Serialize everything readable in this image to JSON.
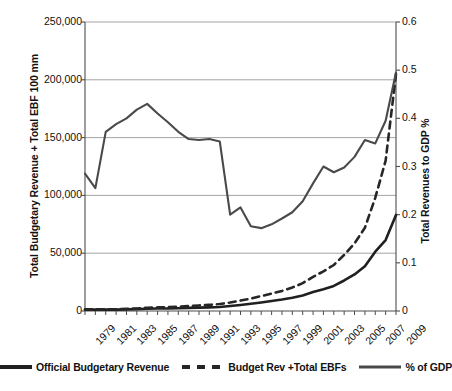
{
  "chart_data": {
    "type": "line",
    "title": "",
    "xlabel": "",
    "ylabel": "Total Budgetary Revenue + Total EBF 100 mm",
    "ylabel_secondary": "Total Revenues to GDP %",
    "grid": true,
    "legend_position": "bottom",
    "x": [
      1979,
      1980,
      1981,
      1982,
      1983,
      1984,
      1985,
      1986,
      1987,
      1988,
      1989,
      1990,
      1991,
      1992,
      1993,
      1994,
      1995,
      1996,
      1997,
      1998,
      1999,
      2000,
      2001,
      2002,
      2003,
      2004,
      2005,
      2006,
      2007,
      2008,
      2009
    ],
    "xtick_labels": [
      "1979",
      "1981",
      "1983",
      "1985",
      "1987",
      "1989",
      "1991",
      "1993",
      "1995",
      "1997",
      "1999",
      "2001",
      "2003",
      "2005",
      "2007",
      "2009"
    ],
    "ylim": [
      0,
      250000
    ],
    "ytick_labels": [
      "0",
      "50,000",
      "100,000",
      "150,000",
      "200,000",
      "250,000"
    ],
    "ytick_values": [
      0,
      50000,
      100000,
      150000,
      200000,
      250000
    ],
    "ylim_secondary": [
      0,
      0.6
    ],
    "ytick_labels_secondary": [
      "0",
      "0.1",
      "0.2",
      "0.3",
      "0.4",
      "0.5",
      "0.6"
    ],
    "ytick_values_secondary": [
      0,
      0.1,
      0.2,
      0.3,
      0.4,
      0.5,
      0.6
    ],
    "series": [
      {
        "name": "Official Budgetary Revenue",
        "axis": "left",
        "style": "solid",
        "width": 2.6,
        "color": "#202020",
        "values": [
          1146,
          1160,
          1176,
          1212,
          1367,
          1643,
          2005,
          2122,
          2199,
          2357,
          2665,
          2937,
          3149,
          3483,
          4349,
          5218,
          6242,
          7408,
          8651,
          9876,
          11444,
          13395,
          16386,
          18904,
          21715,
          26396,
          31649,
          38760,
          51322,
          61330,
          83080
        ]
      },
      {
        "name": "Budget Rev +Total EBFs",
        "axis": "left",
        "style": "dashed",
        "width": 2.6,
        "color": "#262626",
        "values": [
          1380,
          1410,
          1470,
          1560,
          1800,
          2200,
          2800,
          3100,
          3350,
          3700,
          4250,
          4800,
          5300,
          6000,
          7400,
          9000,
          10800,
          12900,
          15100,
          17400,
          20300,
          24100,
          29500,
          34300,
          39800,
          48500,
          58500,
          72000,
          98000,
          130000,
          205000
        ]
      },
      {
        "name": "% of GDP",
        "axis": "right",
        "style": "solid",
        "width": 2.1,
        "color": "#4a4a4a",
        "values": [
          0.285,
          0.255,
          0.372,
          0.388,
          0.4,
          0.418,
          0.43,
          0.41,
          0.392,
          0.372,
          0.357,
          0.355,
          0.357,
          0.352,
          0.2,
          0.215,
          0.176,
          0.172,
          0.18,
          0.192,
          0.205,
          0.228,
          0.265,
          0.3,
          0.288,
          0.298,
          0.32,
          0.355,
          0.348,
          0.395,
          0.495
        ]
      }
    ]
  },
  "legend": {
    "items": [
      {
        "label": "Official Budgetary Revenue",
        "style": "solid",
        "color": "#202020",
        "width": 4
      },
      {
        "label": "Budget Rev +Total EBFs",
        "style": "dashed",
        "color": "#262626",
        "width": 4
      },
      {
        "label": "% of GDP",
        "style": "solid",
        "color": "#4a4a4a",
        "width": 3
      }
    ]
  },
  "colors": {
    "axis": "#4d4d4d",
    "grid": "#9a9a9a",
    "text": "#121212",
    "background": "#ffffff"
  }
}
